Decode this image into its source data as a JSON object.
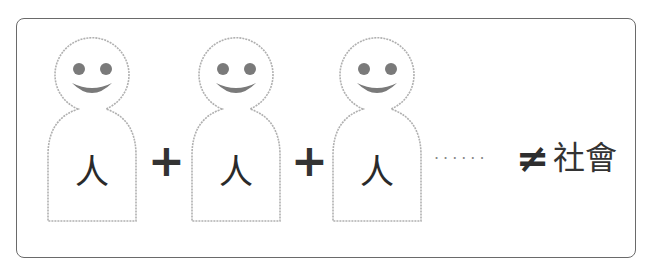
{
  "diagram": {
    "people": [
      {
        "label": "人",
        "left": 46
      },
      {
        "label": "人",
        "left": 190
      },
      {
        "label": "人",
        "left": 331
      }
    ],
    "operators": [
      {
        "symbol": "+",
        "left": 148
      },
      {
        "symbol": "+",
        "left": 291
      }
    ],
    "ellipsis": "······",
    "not_equal": "≠",
    "result": "社會",
    "colors": {
      "outline": "#b0b0b0",
      "face": "#7a7a7a",
      "frame": "#6a6a6a",
      "text": "#2a2a2a"
    }
  }
}
